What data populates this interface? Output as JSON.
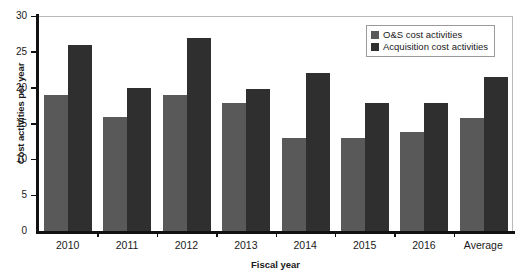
{
  "chart_data": {
    "type": "bar",
    "title": "",
    "xlabel": "Fiscal year",
    "ylabel": "Cost activities per year",
    "categories": [
      "2010",
      "2011",
      "2012",
      "2013",
      "2014",
      "2015",
      "2016",
      "Average"
    ],
    "series": [
      {
        "name": "O&S cost activities",
        "color": "#595959",
        "values": [
          19.0,
          15.9,
          19.0,
          17.8,
          13.0,
          13.0,
          13.8,
          15.7
        ]
      },
      {
        "name": "Acquisition cost activities",
        "color": "#2f2f2f",
        "values": [
          26.0,
          19.9,
          27.0,
          19.8,
          22.0,
          17.8,
          17.8,
          21.5
        ]
      }
    ],
    "ylim": [
      0,
      30
    ],
    "yticks": [
      0,
      5,
      10,
      15,
      20,
      25,
      30
    ],
    "ytick_labels": [
      "0",
      "5",
      "10",
      "15",
      "20",
      "25",
      "30"
    ],
    "grid": false,
    "legend_position": "top-right"
  },
  "legend": {
    "entries": [
      {
        "label": "O&S cost activities",
        "color": "#595959"
      },
      {
        "label": "Acquisition cost activities",
        "color": "#2f2f2f"
      }
    ]
  }
}
